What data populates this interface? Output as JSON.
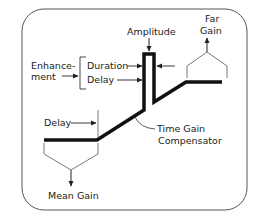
{
  "diagram": {
    "labels": {
      "amplitude": "Amplitude",
      "far_gain_line1": "Far",
      "far_gain_line2": "Gain",
      "enhancement_line1": "Enhance-",
      "enhancement_line2": "ment",
      "duration": "Duration",
      "delay_upper": "Delay",
      "delay_lower": "Delay",
      "tgc_line1": "Time Gain",
      "tgc_line2": "Compensator",
      "mean_gain": "Mean Gain"
    },
    "colors": {
      "line": "#111111",
      "thin_line": "#444444",
      "frame": "#555555",
      "background": "#ffffff"
    }
  }
}
